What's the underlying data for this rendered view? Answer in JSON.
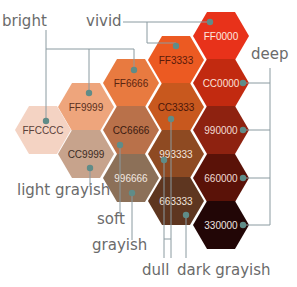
{
  "diagram": {
    "title": "",
    "line_color": "#8a9aa0",
    "dot_color": "#5f8c88",
    "hexagons": [
      {
        "code": "FF0000",
        "fill": "#e8321a",
        "text": "#fde8e0",
        "cx": 221,
        "cy": 36
      },
      {
        "code": "FF3333",
        "fill": "#ec5a22",
        "text": "#5a1a0a",
        "cx": 176,
        "cy": 60
      },
      {
        "code": "FF6666",
        "fill": "#e87a40",
        "text": "#5a2410",
        "cx": 131,
        "cy": 83
      },
      {
        "code": "FF9999",
        "fill": "#eea57c",
        "text": "#5a3020",
        "cx": 86,
        "cy": 107
      },
      {
        "code": "FFCCCC",
        "fill": "#f4d3c3",
        "text": "#5a4038",
        "cx": 43,
        "cy": 130
      },
      {
        "code": "CC0000",
        "fill": "#c22a10",
        "text": "#fbe0d8",
        "cx": 221,
        "cy": 83
      },
      {
        "code": "CC3333",
        "fill": "#c8581e",
        "text": "#4a160a",
        "cx": 176,
        "cy": 107
      },
      {
        "code": "CC6666",
        "fill": "#b9714a",
        "text": "#3a1a10",
        "cx": 131,
        "cy": 130
      },
      {
        "code": "CC9999",
        "fill": "#c7a38c",
        "text": "#3c2c24",
        "cx": 86,
        "cy": 154
      },
      {
        "code": "990000",
        "fill": "#8e2210",
        "text": "#f2dcd4",
        "cx": 221,
        "cy": 130
      },
      {
        "code": "993333",
        "fill": "#8e4a22",
        "text": "#f2e4dc",
        "cx": 176,
        "cy": 154
      },
      {
        "code": "996666",
        "fill": "#8c7058",
        "text": "#f2e8e0",
        "cx": 131,
        "cy": 178
      },
      {
        "code": "660000",
        "fill": "#5a1208",
        "text": "#f0dcd4",
        "cx": 221,
        "cy": 178
      },
      {
        "code": "663333",
        "fill": "#5e3620",
        "text": "#f0e4dc",
        "cx": 176,
        "cy": 201
      },
      {
        "code": "330000",
        "fill": "#220606",
        "text": "#eee4e0",
        "cx": 221,
        "cy": 225
      }
    ],
    "categories": [
      {
        "id": "bright",
        "label": "bright",
        "x": 2,
        "y": 26
      },
      {
        "id": "vivid",
        "label": "vivid",
        "x": 86,
        "y": 26
      },
      {
        "id": "deep",
        "label": "deep",
        "x": 251,
        "y": 59
      },
      {
        "id": "light-grayish",
        "label": "light grayish",
        "x": 17,
        "y": 195
      },
      {
        "id": "soft",
        "label": "soft",
        "x": 97,
        "y": 224
      },
      {
        "id": "grayish",
        "label": "grayish",
        "x": 92,
        "y": 250
      },
      {
        "id": "dull",
        "label": "dull",
        "x": 142,
        "y": 275
      },
      {
        "id": "dark-grayish",
        "label": "dark grayish",
        "x": 177,
        "y": 275
      }
    ]
  }
}
